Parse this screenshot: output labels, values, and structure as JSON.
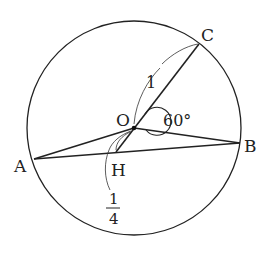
{
  "diagram": {
    "type": "circle-geometry",
    "circle": {
      "center_label": "O",
      "radius_label": "1"
    },
    "points": {
      "A": "A",
      "B": "B",
      "C": "C",
      "O": "O",
      "H": "H"
    },
    "angle_label": "60°",
    "angle_value": "60",
    "angle_unit": "°",
    "length_OC": "1",
    "length_OH_num": "1",
    "length_OH_den": "4",
    "segments": [
      "OC",
      "OH",
      "OA",
      "OB",
      "AB"
    ]
  }
}
